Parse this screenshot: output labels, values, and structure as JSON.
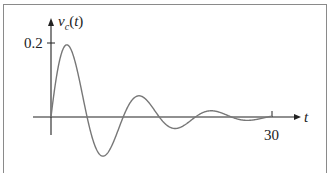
{
  "chart_data": {
    "type": "line",
    "title": "",
    "xlabel": "t",
    "ylabel": "v_c(t)",
    "x_ticks": [
      30
    ],
    "y_ticks": [
      0.2
    ],
    "xlim": [
      0,
      31
    ],
    "ylim": [
      -0.17,
      0.26
    ],
    "grid": false,
    "legend": null,
    "series": [
      {
        "name": "v_c(t)",
        "x": [
          0,
          1.2,
          3.6,
          6.1,
          8.6,
          11.0,
          13.5,
          15.9,
          18.4,
          20.8,
          23.3,
          25.7,
          28.2,
          30
        ],
        "values": [
          0,
          0.17,
          -0.115,
          0.09,
          -0.065,
          0.049,
          -0.035,
          0.027,
          -0.02,
          0.014,
          -0.01,
          0.008,
          -0.005,
          0.002
        ]
      }
    ]
  },
  "labels": {
    "ylabel_main": "v",
    "ylabel_sub": "c",
    "ylabel_tail": "(t)",
    "ytick": "0.2",
    "xlabel": "t",
    "xtick": "30"
  }
}
